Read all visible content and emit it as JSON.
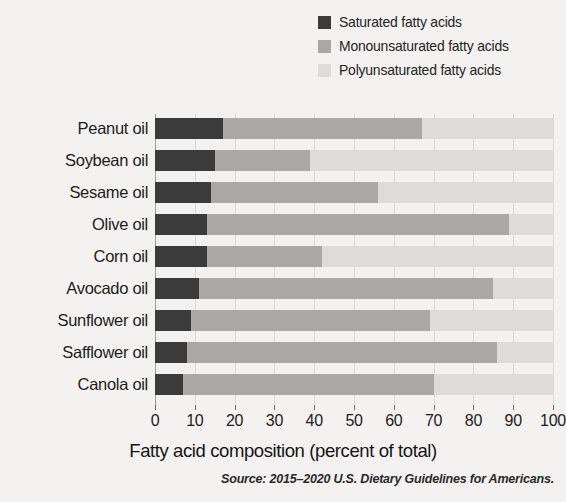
{
  "chart_data": {
    "type": "bar",
    "orientation": "horizontal",
    "stacked": true,
    "title": "",
    "xlabel": "Fatty acid composition (percent of total)",
    "ylabel": "",
    "xlim": [
      0,
      100
    ],
    "xticks": [
      0,
      10,
      20,
      30,
      40,
      50,
      60,
      70,
      80,
      90,
      100
    ],
    "grid": true,
    "legend_position": "top-right",
    "categories": [
      "Peanut oil",
      "Soybean oil",
      "Sesame oil",
      "Olive oil",
      "Corn oil",
      "Avocado oil",
      "Sunflower oil",
      "Safflower oil",
      "Canola oil"
    ],
    "series": [
      {
        "name": "Saturated fatty acids",
        "color": "#3b3b3b",
        "values": [
          17,
          15,
          14,
          13,
          13,
          11,
          9,
          8,
          7
        ]
      },
      {
        "name": "Monounsaturated fatty acids",
        "color": "#a9a8a6",
        "values": [
          50,
          24,
          42,
          76,
          29,
          74,
          60,
          78,
          63
        ]
      },
      {
        "name": "Polyunsaturated fatty acids",
        "color": "#dddcd9",
        "values": [
          33,
          61,
          44,
          11,
          58,
          15,
          31,
          14,
          30
        ]
      }
    ],
    "source": "Source: 2015–2020 U.S. Dietary Guidelines for Americans."
  },
  "legend": {
    "items": [
      {
        "label": "Saturated fatty acids",
        "color": "#3b3b3b"
      },
      {
        "label": "Monounsaturated fatty acids",
        "color": "#a9a8a6"
      },
      {
        "label": "Polyunsaturated fatty acids",
        "color": "#dddcd9"
      }
    ]
  },
  "axis": {
    "x_title": "Fatty acid composition (percent of total)",
    "tick_labels": [
      "0",
      "10",
      "20",
      "30",
      "40",
      "50",
      "60",
      "70",
      "80",
      "90",
      "100"
    ]
  },
  "footer": {
    "source": "Source: 2015–2020 U.S. Dietary Guidelines for Americans."
  }
}
